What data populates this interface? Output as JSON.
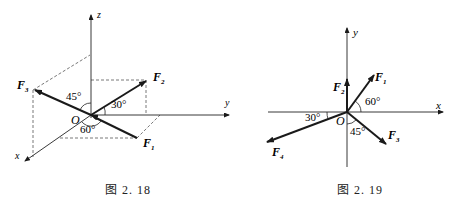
{
  "figures": [
    {
      "id": "fig-2-18",
      "caption": "图 2. 18",
      "axes": {
        "z": "z",
        "y": "y",
        "x": "x"
      },
      "origin": "O",
      "forces": [
        {
          "name": "F",
          "sub": "1",
          "desc": "in x-y plane, 60° from x-axis"
        },
        {
          "name": "F",
          "sub": "2",
          "desc": "in y-z plane, 30° above y-axis"
        },
        {
          "name": "F",
          "sub": "3",
          "desc": "in x-z plane, 45° from z-axis"
        }
      ],
      "angles": [
        "45°",
        "30°",
        "60°"
      ]
    },
    {
      "id": "fig-2-19",
      "caption": "图 2. 19",
      "axes": {
        "x": "x",
        "y": "y"
      },
      "origin": "O",
      "forces": [
        {
          "name": "F",
          "sub": "1",
          "desc": "60° above +x"
        },
        {
          "name": "F",
          "sub": "2",
          "desc": "along +y"
        },
        {
          "name": "F",
          "sub": "3",
          "desc": "45° from -y toward +x"
        },
        {
          "name": "F",
          "sub": "4",
          "desc": "30° below -x"
        }
      ],
      "angles": [
        "60°",
        "30°",
        "45°"
      ]
    }
  ]
}
